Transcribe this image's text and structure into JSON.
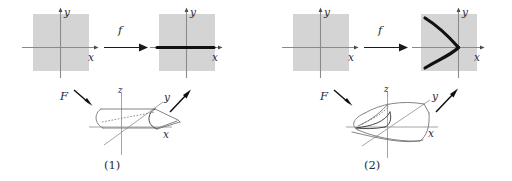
{
  "figure": {
    "caption_hidden": "",
    "background_color": "#ffffff",
    "plane_fill_color": "#d4d4d4",
    "axis_color": "#8a8a8a",
    "curve_color": "#111111",
    "surface_color": "#6e6e6e"
  },
  "panels": [
    {
      "id": "panel-1",
      "number_label": "(1)",
      "singularity_type": "fold",
      "map_label": "f",
      "lift_label": "F",
      "source_plane": {
        "x_label": "x",
        "y_label": "y",
        "image_content": "none"
      },
      "target_plane": {
        "x_label": "x",
        "y_label": "y",
        "image_content": "thick-horizontal-segment"
      },
      "surface": {
        "x_label": "x",
        "y_label": "y",
        "z_label": "z",
        "name": "fold-surface"
      }
    },
    {
      "id": "panel-2",
      "number_label": "(2)",
      "singularity_type": "cusp",
      "map_label": "f",
      "lift_label": "F",
      "source_plane": {
        "x_label": "x",
        "y_label": "y",
        "image_content": "none"
      },
      "target_plane": {
        "x_label": "x",
        "y_label": "y",
        "image_content": "cusp-curve"
      },
      "surface": {
        "x_label": "x",
        "y_label": "y",
        "z_label": "z",
        "name": "cusp-surface"
      }
    }
  ]
}
